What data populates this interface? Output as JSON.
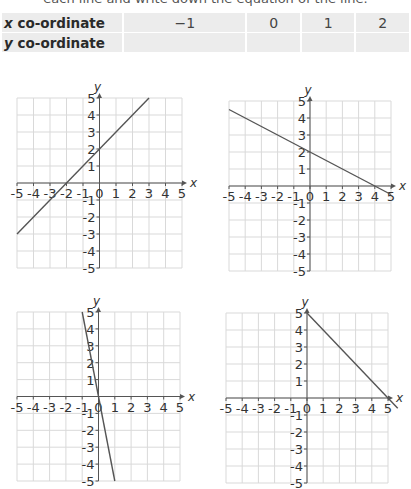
{
  "instruction": "each line and write down the equation of the line.",
  "table": {
    "rows": [
      {
        "label_var": "x",
        "label_rest": " co-ordinate",
        "values": [
          "−1",
          "0",
          "1",
          "2"
        ]
      },
      {
        "label_var": "y",
        "label_rest": " co-ordinate",
        "values": [
          "",
          "",
          "",
          ""
        ]
      }
    ]
  },
  "colors": {
    "grid": "#d9d9d9",
    "axis": "#555555",
    "line": "#555555",
    "table_bg": "#ececec"
  },
  "chart_data": [
    {
      "type": "line",
      "title": "Graph A",
      "xlabel": "x",
      "ylabel": "y",
      "xlim": [
        -5,
        5
      ],
      "ylim": [
        -5,
        5
      ],
      "xticks": [
        -5,
        -4,
        -3,
        -2,
        -1,
        0,
        1,
        2,
        3,
        4,
        5
      ],
      "yticks": [
        -5,
        -4,
        -3,
        -2,
        -1,
        1,
        2,
        3,
        4,
        5
      ],
      "grid": true,
      "series": [
        {
          "name": "line",
          "x": [
            -5,
            3
          ],
          "y": [
            -3,
            5
          ]
        }
      ],
      "equation": "y = x + 2",
      "box": {
        "left": 17,
        "top": 98,
        "width": 165,
        "height": 170
      }
    },
    {
      "type": "line",
      "title": "Graph B",
      "xlabel": "x",
      "ylabel": "y",
      "xlim": [
        -5,
        5
      ],
      "ylim": [
        -5,
        5
      ],
      "xticks": [
        -5,
        -4,
        -3,
        -2,
        -1,
        0,
        1,
        2,
        3,
        4,
        5
      ],
      "yticks": [
        -5,
        -4,
        -3,
        -2,
        -1,
        1,
        2,
        3,
        4,
        5
      ],
      "grid": true,
      "series": [
        {
          "name": "line",
          "x": [
            -5,
            5
          ],
          "y": [
            4.5,
            -0.5
          ]
        }
      ],
      "equation": "y = -0.5x + 2",
      "box": {
        "left": 229,
        "top": 101,
        "width": 162,
        "height": 170
      }
    },
    {
      "type": "line",
      "title": "Graph C",
      "xlabel": "x",
      "ylabel": "y",
      "xlim": [
        -5,
        5
      ],
      "ylim": [
        -5,
        5
      ],
      "xticks": [
        -5,
        -4,
        -3,
        -2,
        -1,
        0,
        1,
        2,
        3,
        4,
        5
      ],
      "yticks": [
        -5,
        -4,
        -3,
        -2,
        -1,
        1,
        2,
        3,
        4,
        5
      ],
      "grid": true,
      "series": [
        {
          "name": "line",
          "x": [
            -1,
            1
          ],
          "y": [
            5,
            -5
          ]
        }
      ],
      "equation": "y = -5x",
      "box": {
        "left": 17,
        "top": 312,
        "width": 163,
        "height": 169
      }
    },
    {
      "type": "line",
      "title": "Graph D",
      "xlabel": "x",
      "ylabel": "y",
      "xlim": [
        -5,
        5
      ],
      "ylim": [
        -5,
        5
      ],
      "xticks": [
        -5,
        -4,
        -3,
        -2,
        -1,
        0,
        1,
        2,
        3,
        4,
        5
      ],
      "yticks": [
        -5,
        -4,
        -3,
        -2,
        -1,
        1,
        2,
        3,
        4,
        5
      ],
      "grid": true,
      "series": [
        {
          "name": "line",
          "x": [
            0,
            5.6
          ],
          "y": [
            5,
            -0.6
          ]
        }
      ],
      "equation": "y = -x + 5",
      "box": {
        "left": 226,
        "top": 313,
        "width": 162,
        "height": 170
      }
    }
  ]
}
